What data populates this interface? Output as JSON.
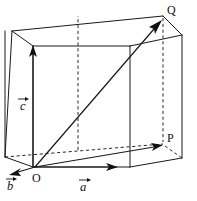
{
  "figure": {
    "colors": {
      "background": "#ffffff",
      "stroke": "#1a1a1a",
      "hidden_stroke": "#2b2b2b",
      "label": "#111111"
    },
    "points": [
      {
        "id": "O",
        "label": "O",
        "x": 35,
        "y": 167,
        "label_x": 32,
        "label_y": 182,
        "role": "origin"
      },
      {
        "id": "P",
        "label": "P",
        "x": 163,
        "y": 144,
        "label_x": 167,
        "label_y": 142,
        "role": "vertex-back-bottom-right"
      },
      {
        "id": "Q",
        "label": "Q",
        "x": 163,
        "y": 17,
        "label_x": 167,
        "label_y": 14,
        "role": "vertex-back-top-right"
      }
    ],
    "vectors": [
      {
        "id": "a",
        "label": "a",
        "label_x": 79,
        "label_y": 191,
        "accent_x": 79,
        "accent_y": 178,
        "accent_w": 11,
        "from_x": 35,
        "from_y": 167,
        "to_x": 117,
        "to_y": 167,
        "description": "vector a along bottom front edge pointing right"
      },
      {
        "id": "b",
        "label": "b",
        "label_x": 9,
        "label_y": 189,
        "accent_x": 8,
        "accent_y": 176,
        "accent_w": 10,
        "from_x": 35,
        "from_y": 167,
        "to_x": 11,
        "to_y": 174,
        "description": "vector b pointing down-left toward back-bottom-left"
      },
      {
        "id": "c",
        "label": "c",
        "label_x": 20,
        "label_y": 110,
        "accent_x": 19,
        "accent_y": 97,
        "accent_w": 11,
        "from_x": 33,
        "from_y": 167,
        "to_x": 33,
        "to_y": 48,
        "description": "vector c pointing up along front-left vertical edge"
      }
    ],
    "diagonal": {
      "id": "OQ",
      "from_x": 35,
      "from_y": 167,
      "to_x": 161,
      "to_y": 21,
      "description": "space diagonal from O to Q"
    },
    "box": {
      "front_bottom_left": {
        "x": 33,
        "y": 167
      },
      "front_bottom_right": {
        "x": 130,
        "y": 167
      },
      "front_top_left": {
        "x": 33,
        "y": 46
      },
      "front_top_right": {
        "x": 130,
        "y": 46
      },
      "back_bottom_left": {
        "x": 5,
        "y": 157
      },
      "back_bottom_right": {
        "x": 163,
        "y": 144
      },
      "back_top_left": {
        "x": 12,
        "y": 31
      },
      "back_top_right": {
        "x": 163,
        "y": 16
      },
      "right_bottom_outer": {
        "x": 182,
        "y": 158
      },
      "right_top_outer": {
        "x": 182,
        "y": 35
      }
    }
  }
}
